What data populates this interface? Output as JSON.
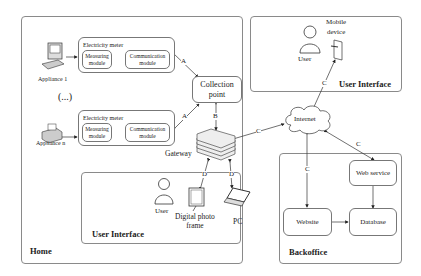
{
  "regions": {
    "home": "Home",
    "user_interface_home": "User Interface",
    "user_interface_mobile": "User Interface",
    "backoffice": "Backoffice"
  },
  "appliances": [
    {
      "label": "Appliance 1"
    },
    {
      "label": "Appliance n"
    }
  ],
  "ellipsis": "(...)",
  "meters": [
    {
      "title": "Electricity meter",
      "measuring": [
        "Measuring",
        "module"
      ],
      "communication": [
        "Communication",
        "module"
      ]
    },
    {
      "title": "Electricity meter",
      "measuring": [
        "Measuring",
        "module"
      ],
      "communication": [
        "Communication",
        "module"
      ]
    }
  ],
  "collection_point": [
    "Collection",
    "point"
  ],
  "gateway": "Gateway",
  "internet": "Internet",
  "mobile": {
    "device": [
      "Mobile",
      "device"
    ],
    "user": "User"
  },
  "home_ui": {
    "user": "User",
    "photo_frame": [
      "Digital photo",
      "frame"
    ],
    "pc": "PC"
  },
  "backoffice": {
    "web_service": "Web service",
    "website": "Website",
    "database": "Database"
  },
  "links": {
    "A1": "A",
    "A2": "A",
    "B": "B",
    "C_gw": "C",
    "C_mobile": "C",
    "C_web": "C",
    "C_site": "C",
    "D1": "D",
    "D2": "D"
  }
}
